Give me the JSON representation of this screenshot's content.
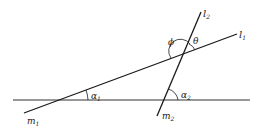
{
  "diagram": {
    "lines": {
      "l1": {
        "label": "l",
        "subscript": "1"
      },
      "l2": {
        "label": "l",
        "subscript": "2"
      },
      "m1": {
        "label": "m",
        "subscript": "1"
      },
      "m2": {
        "label": "m",
        "subscript": "2"
      },
      "baseline": {
        "label": ""
      }
    },
    "angles": {
      "alpha1": {
        "label": "α",
        "subscript": "1"
      },
      "alpha2": {
        "label": "α",
        "subscript": "2"
      },
      "phi": {
        "label": "ϕ"
      },
      "theta": {
        "label": "θ"
      }
    },
    "colors": {
      "stroke": "#1a1a1a"
    }
  }
}
